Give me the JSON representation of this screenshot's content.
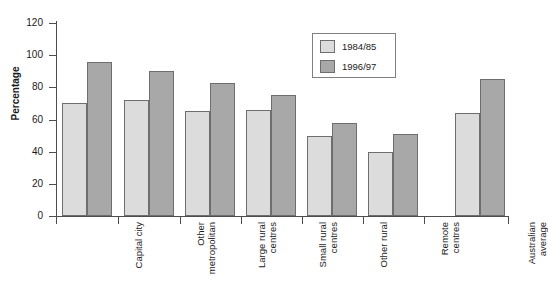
{
  "chart_data": {
    "type": "bar",
    "title": "",
    "xlabel": "",
    "ylabel": "Percentage",
    "ylim": [
      0,
      120
    ],
    "yticks": [
      0,
      20,
      40,
      60,
      80,
      100,
      120
    ],
    "grid": false,
    "legend_position": "top-right",
    "categories": [
      "Capital city",
      "Other metropolitan",
      "Large rural centres",
      "Small rural centres",
      "Other rural",
      "Remote centres",
      "Australian average"
    ],
    "series": [
      {
        "name": "1984/85",
        "color": "#dcdcdc",
        "values": [
          70,
          72,
          65,
          66,
          50,
          40,
          64
        ]
      },
      {
        "name": "1996/97",
        "color": "#a8a8a8",
        "values": [
          96,
          90,
          83,
          75,
          58,
          51,
          85
        ]
      }
    ]
  },
  "legend": {
    "items": [
      {
        "label": "1984/85"
      },
      {
        "label": "1996/97"
      }
    ]
  },
  "axis": {
    "y_title": "Percentage"
  }
}
